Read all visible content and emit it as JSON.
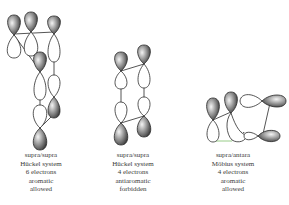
{
  "diagrams": [
    {
      "id": "huckel-6",
      "caption": {
        "line1": "supra/supra",
        "line2": "Hückel system",
        "line3": "6 electrons",
        "line4": "aromatic",
        "line5": "allowed"
      }
    },
    {
      "id": "huckel-4",
      "caption": {
        "line1": "supra/supra",
        "line2": "Hückel system",
        "line3": "4 electrons",
        "line4": "antiaromatic",
        "line5": "forbidden"
      }
    },
    {
      "id": "mobius-4",
      "caption": {
        "line1": "supra/antara",
        "line2": "Möbius system",
        "line3": "4 electrons",
        "line4": "aromatic",
        "line5": "allowed"
      }
    }
  ],
  "colors": {
    "lobe_outline": "#2a2a2a",
    "shaded_dark": "#3c3c3c",
    "shaded_light": "#e8e8e8",
    "connector": "#333333",
    "mobius_highlight": "#7fbf6a",
    "caption_text": "#3a3a3a"
  }
}
